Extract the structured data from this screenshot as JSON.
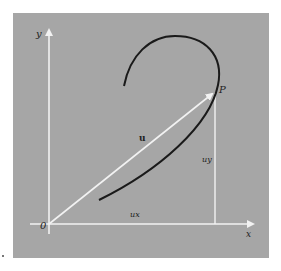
{
  "figure": {
    "background_color": "#a6a6a6",
    "axis_color": "#f2f2f2",
    "curve_color": "#1a1a1a",
    "labels": {
      "y_axis": "y",
      "x_axis": "x",
      "origin": "0",
      "point": "P",
      "vector": "u",
      "x_component": "ux",
      "y_component": "uy"
    }
  }
}
